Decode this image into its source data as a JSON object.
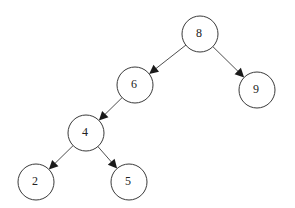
{
  "diagram": {
    "type": "binary-search-tree",
    "nodes": [
      {
        "id": "n8",
        "label": "8"
      },
      {
        "id": "n6",
        "label": "6"
      },
      {
        "id": "n9",
        "label": "9"
      },
      {
        "id": "n4",
        "label": "4"
      },
      {
        "id": "n2",
        "label": "2"
      },
      {
        "id": "n5",
        "label": "5"
      }
    ],
    "edges": [
      {
        "from": "n8",
        "to": "n6"
      },
      {
        "from": "n8",
        "to": "n9"
      },
      {
        "from": "n6",
        "to": "n4"
      },
      {
        "from": "n4",
        "to": "n2"
      },
      {
        "from": "n4",
        "to": "n5"
      }
    ]
  }
}
